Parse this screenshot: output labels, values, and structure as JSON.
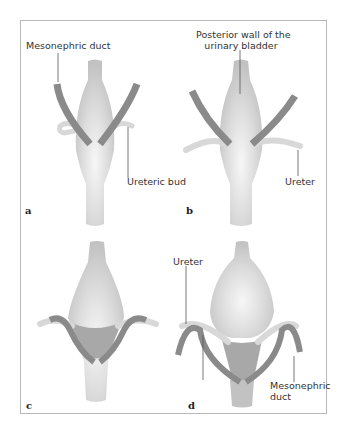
{
  "figure": {
    "panels": [
      {
        "id": "a",
        "letter": "a",
        "labels": {
          "top": "Mesonephric duct",
          "side": "Ureteric bud"
        }
      },
      {
        "id": "b",
        "letter": "b",
        "labels": {
          "top_line1": "Posterior wall of the",
          "top_line2": "urinary bladder",
          "side": "Ureter"
        }
      },
      {
        "id": "c",
        "letter": "c",
        "labels": {}
      },
      {
        "id": "d",
        "letter": "d",
        "labels": {
          "top": "Ureter",
          "side_line1": "Mesonephric",
          "side_line2": "duct"
        }
      }
    ],
    "colors": {
      "bladder": "#c9c9c9",
      "bladder_highlight": "#f4f4f4",
      "duct": "#8a8a8a",
      "ureter": "#e2e2e2",
      "trigone": "#a8a8a8",
      "frame": "#b8b8b8"
    }
  }
}
